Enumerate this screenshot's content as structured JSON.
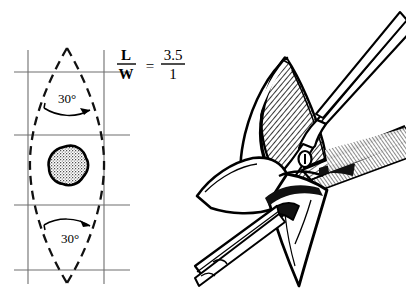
{
  "figure": {
    "background_color": "#ffffff",
    "ink_color": "#000000",
    "grid_color": "#6e6e6e"
  },
  "left_panel": {
    "name": "elliptical-excision-diagram",
    "formula": {
      "numerator_left": "L",
      "denominator_left": "W",
      "equals": "=",
      "numerator_right": "3.5",
      "denominator_right": "1"
    },
    "angles": [
      {
        "id": "apex-angle-top",
        "label": "30°"
      },
      {
        "id": "apex-angle-bottom",
        "label": "30°"
      }
    ],
    "lesion": {
      "name": "stippled-lesion",
      "shape": "irregular-round"
    },
    "ellipse": {
      "style": "dashed",
      "top_apex": [
        67,
        48
      ],
      "bottom_apex": [
        67,
        283
      ],
      "half_width": 38
    },
    "grid": {
      "vertical_lines_x": [
        28,
        104
      ],
      "horizontal_lines_y": [
        72,
        135,
        205,
        270
      ],
      "vertical_extent": [
        50,
        284
      ],
      "horizontal_extent": [
        14,
        130
      ]
    }
  },
  "right_panel": {
    "name": "surgical-dissection-illustration",
    "instruments": [
      {
        "id": "scissors",
        "label": "scissors"
      },
      {
        "id": "forceps",
        "label": "forceps"
      }
    ],
    "tissue": [
      {
        "id": "excised-flap",
        "label": "crosshatched-flap"
      },
      {
        "id": "skin-edge",
        "label": "skin-edge"
      }
    ]
  }
}
